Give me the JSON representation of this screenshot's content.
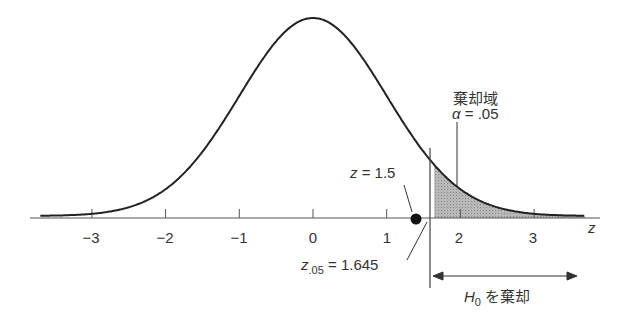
{
  "chart_data": {
    "type": "area",
    "title": "",
    "xlabel": "z",
    "ylabel": "",
    "distribution": "standard normal",
    "xlim": [
      -3.7,
      3.8
    ],
    "x_ticks": [
      -3,
      -2,
      -1,
      0,
      1,
      2,
      3
    ],
    "tick_labels": [
      "−3",
      "−2",
      "−1",
      "0",
      "1",
      "2",
      "3"
    ],
    "shaded_region": {
      "from": 1.645,
      "to": 3.8,
      "label": "棄却域",
      "alpha": 0.05
    },
    "critical_value": 1.645,
    "observed_z": 1.5,
    "annotations": [
      {
        "text": "棄却域",
        "x": 2.1
      },
      {
        "text": "α = .05",
        "x": 2.1
      },
      {
        "text": "z = 1.5",
        "x": 1.5
      },
      {
        "text": "z.05 = 1.645",
        "x": 1.645
      },
      {
        "text": "H0 を棄却",
        "x_range": [
          1.645,
          3.6
        ]
      }
    ],
    "grid": false,
    "legend": "none"
  },
  "labels": {
    "axis_z": "z",
    "reject_region": "棄却域",
    "alpha_sym": "α",
    "alpha_val": " = .05",
    "z_obs_var": "z",
    "z_obs_val": " = 1.5",
    "z_crit_var": "z",
    "z_crit_sub": ".05",
    "z_crit_val": " = 1.645",
    "h0_var": "H",
    "h0_sub": "0",
    "h0_text": " を棄却"
  }
}
